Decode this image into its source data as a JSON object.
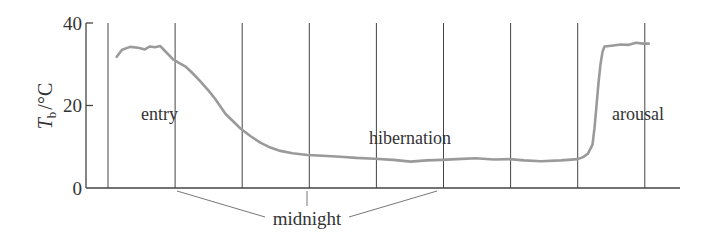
{
  "chart_data": {
    "type": "line",
    "title": "",
    "xlabel": "",
    "ylabel": "T_b / °C",
    "ylabel_parts": {
      "symbol": "T",
      "subscript": "b",
      "unit": "/°C"
    },
    "ylim": [
      0,
      40
    ],
    "yticks": [
      0,
      20,
      40
    ],
    "ytick_labels": [
      "0",
      "20",
      "40"
    ],
    "x_grid_lines": 9,
    "x_grid_units": "interval index (vertical lines at equal time intervals)",
    "grid": {
      "vertical": true,
      "horizontal": false
    },
    "legend": null,
    "series": [
      {
        "name": "body temperature",
        "color": "#9a9a9a",
        "x": [
          0.13,
          0.21,
          0.33,
          0.45,
          0.55,
          0.62,
          0.7,
          0.78,
          0.85,
          0.97,
          1.05,
          1.15,
          1.25,
          1.37,
          1.5,
          1.6,
          1.75,
          1.97,
          2.12,
          2.27,
          2.42,
          2.57,
          2.75,
          2.97,
          3.2,
          3.46,
          3.7,
          3.97,
          4.25,
          4.51,
          4.75,
          4.97,
          5.2,
          5.48,
          5.75,
          5.99,
          6.2,
          6.45,
          6.75,
          7.0,
          7.08,
          7.15,
          7.22,
          7.25,
          7.28,
          7.31,
          7.34,
          7.37,
          7.4,
          7.5,
          7.64,
          7.75,
          7.87,
          7.97,
          8.06
        ],
        "values": [
          31.8,
          33.5,
          34.2,
          34.0,
          33.6,
          34.3,
          34.1,
          34.4,
          33.2,
          31.2,
          30.4,
          29.5,
          28.0,
          26.0,
          23.6,
          21.5,
          18.0,
          14.5,
          12.6,
          11.0,
          9.8,
          9.0,
          8.4,
          8.0,
          7.8,
          7.6,
          7.3,
          7.1,
          6.8,
          6.4,
          6.7,
          6.8,
          7.0,
          7.2,
          6.9,
          7.0,
          6.7,
          6.5,
          6.7,
          7.0,
          7.5,
          8.3,
          10.5,
          14.5,
          20.0,
          25.5,
          30.0,
          33.0,
          34.3,
          34.5,
          34.8,
          34.7,
          35.2,
          35.0,
          35.0
        ]
      }
    ],
    "annotations": [
      {
        "text": "entry",
        "x": 0.5,
        "y": 17.0
      },
      {
        "text": "hibernation",
        "x": 4.4,
        "y": 11.0
      },
      {
        "text": "arousal",
        "x": 7.8,
        "y": 19.0
      },
      {
        "text": "midnight",
        "x": 2.97,
        "y": -8.5,
        "points_to_grid_lines": [
          1,
          3,
          5
        ]
      }
    ]
  },
  "labels": {
    "y_symbol": "T",
    "y_subscript": "b",
    "y_unit": "/°C",
    "entry": "entry",
    "hibernation": "hibernation",
    "arousal": "arousal",
    "midnight": "midnight",
    "tick_0": "0",
    "tick_20": "20",
    "tick_40": "40"
  },
  "colors": {
    "curve": "#9a9a9a",
    "axis": "#444444",
    "grid": "#444444",
    "pointer": "#777777",
    "text": "#333333"
  }
}
